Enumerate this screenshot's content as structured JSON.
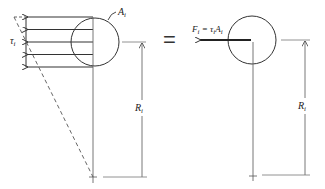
{
  "diagram": {
    "type": "free-body equivalence of shear stress distribution",
    "equals_sign": "=",
    "left_panel": {
      "area_label": "A",
      "area_subscript": "i",
      "stress_label": "τ",
      "stress_subscript": "i",
      "radius_label": "R",
      "radius_subscript": "i",
      "arrow_count": 5
    },
    "right_panel": {
      "force_label": "F",
      "force_subscript": "i",
      "force_eq": " = τ",
      "force_eq_sub": "i",
      "force_eq_tail": "A",
      "force_eq_tail_sub": "i",
      "radius_label": "R",
      "radius_subscript": "i"
    },
    "colors": {
      "line": "#333333",
      "dashed": "#555555",
      "thin": "#777777"
    }
  }
}
